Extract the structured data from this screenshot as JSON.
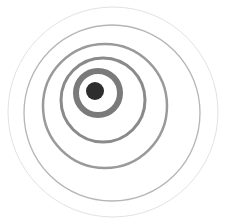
{
  "icon": {
    "name": "ripple-signal-icon",
    "background": "#ffffff",
    "dot": {
      "cx": 95,
      "cy": 91,
      "r": 9,
      "color": "#2e2e2e"
    },
    "rings": [
      {
        "cx": 98,
        "cy": 93,
        "r": 22,
        "stroke": 6,
        "color": "#7a7a7a",
        "opacity": 1
      },
      {
        "cx": 103,
        "cy": 100,
        "r": 42,
        "stroke": 3,
        "color": "#8a8a8a",
        "opacity": 1
      },
      {
        "cx": 105,
        "cy": 106,
        "r": 62,
        "stroke": 2.5,
        "color": "#9a9a9a",
        "opacity": 1
      },
      {
        "cx": 112,
        "cy": 113,
        "r": 88,
        "stroke": 1.3,
        "color": "#b5b5b5",
        "opacity": 1
      },
      {
        "cx": 113,
        "cy": 112,
        "r": 105,
        "stroke": 1,
        "color": "#e2e2e2",
        "opacity": 1
      }
    ]
  }
}
